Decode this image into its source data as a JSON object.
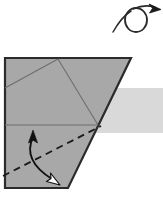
{
  "figure": {
    "kind": "origami-diagram",
    "title": "Origami step diagram: turn over and valley fold",
    "canvas": {
      "width": 163,
      "height": 200,
      "background": "#ffffff"
    },
    "colors": {
      "paper_fill": "#a8a8a8",
      "paper_outline": "#2b2b2b",
      "crease_line": "#6e6e6e",
      "shadow_band": "#d9d9d9",
      "fold_line": "#1a1a1a",
      "arrow_stroke": "#111111",
      "arrowhead_solid": "#111111",
      "arrowhead_hollow_fill": "#ffffff"
    },
    "symbols": {
      "turn_over": {
        "name": "turn-over-symbol",
        "label": "Turn over",
        "loop_center_x": 136,
        "loop_center_y": 20,
        "loop_rx": 11,
        "loop_ry": 12,
        "tail_path": "M 115 31 C 120 24 127 14 135 10",
        "arrow_tip_x": 159,
        "arrow_tip_y": 8
      },
      "valley_fold_line": {
        "name": "valley-fold-line",
        "label": "Valley fold (dashed)",
        "x1": 3,
        "y1": 176,
        "x2": 101,
        "y2": 126,
        "dash": "7 5",
        "width": 1.8
      },
      "fold_arrow": {
        "name": "fold-direction-arrow",
        "label": "Fold up and down (double-headed)",
        "path": "M 33 137 C 26 152 31 166 52 179",
        "head_top": {
          "x": 33,
          "y": 133,
          "style": "solid",
          "angle": -14
        },
        "head_bottom": {
          "x": 56,
          "y": 182,
          "style": "hollow",
          "angle": 36
        }
      }
    },
    "paper": {
      "name": "folded-paper-shape",
      "outline_points": "5,58 131,58 68,188 5,188",
      "creases": [
        {
          "name": "crease-upper-left-diagonal",
          "x1": 5,
          "y1": 88,
          "x2": 58,
          "y2": 59
        },
        {
          "name": "crease-upper-right-diagonal",
          "x1": 58,
          "y1": 59,
          "x2": 98,
          "y2": 125
        },
        {
          "name": "crease-horizontal",
          "x1": 5,
          "y1": 125,
          "x2": 98,
          "y2": 125
        }
      ]
    },
    "shadow": {
      "name": "background-shadow-band",
      "x": 96,
      "y": 88,
      "width": 67,
      "height": 45
    }
  }
}
